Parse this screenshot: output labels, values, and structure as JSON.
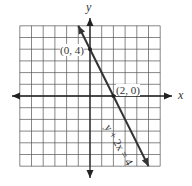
{
  "chart_data": {
    "type": "line",
    "title": "",
    "xlabel": "x",
    "ylabel": "y",
    "xlim": [
      -6,
      6
    ],
    "ylim": [
      -6,
      6
    ],
    "grid": true,
    "series": [
      {
        "name": "y + 2x = 4",
        "equation": "y + 2x = 4",
        "x": [
          -1,
          5
        ],
        "y": [
          6,
          -6
        ]
      }
    ],
    "points": [
      {
        "label": "(0, 4)",
        "x": 0,
        "y": 4
      },
      {
        "label": "(2, 0)",
        "x": 2,
        "y": 0
      }
    ]
  },
  "labels": {
    "x_axis": "x",
    "y_axis": "y",
    "point_a": "(0, 4)",
    "point_b": "(2, 0)",
    "line_equation": "y + 2x = 4"
  }
}
